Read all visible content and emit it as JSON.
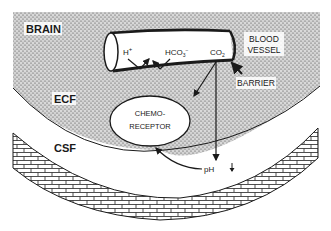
{
  "diagram": {
    "type": "physiology-schematic",
    "regions": {
      "brain": "BRAIN",
      "ecf": "ECF",
      "csf": "CSF"
    },
    "blood_vessel": {
      "label_line1": "BLOOD",
      "label_line2": "VESSEL",
      "ions": {
        "h_plus": "H",
        "h_plus_sup": "+",
        "bicarbonate": "HCO",
        "bicarbonate_sub": "3",
        "bicarbonate_sup": "−",
        "co2": "CO",
        "co2_sub": "2"
      }
    },
    "barrier_label": "BARRIER",
    "chemoreceptor": {
      "line1": "CHEMO-",
      "line2": "RECEPTOR"
    },
    "ph_label": "pH",
    "ph_direction_icon": "down-arrow",
    "colors": {
      "ink": "#1a1a1a",
      "stipple_bg": "#cfcfcf",
      "paper": "#ffffff"
    }
  }
}
